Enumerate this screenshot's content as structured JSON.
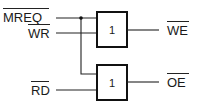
{
  "diagram": {
    "type": "logic-circuit",
    "inputs": [
      {
        "name": "MREQ",
        "active_low": true
      },
      {
        "name": "WR",
        "active_low": true
      },
      {
        "name": "RD",
        "active_low": true
      }
    ],
    "gates": [
      {
        "id": "g1",
        "label": "1",
        "inputs": [
          "MREQ",
          "WR"
        ],
        "output": "WE"
      },
      {
        "id": "g2",
        "label": "1",
        "inputs": [
          "MREQ",
          "RD"
        ],
        "output": "OE"
      }
    ],
    "outputs": [
      {
        "name": "WE",
        "active_low": true
      },
      {
        "name": "OE",
        "active_low": true
      }
    ],
    "colors": {
      "line": "#222222",
      "background": "#ffffff"
    }
  }
}
